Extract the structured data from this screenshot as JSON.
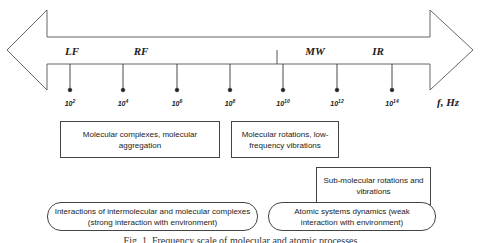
{
  "figure": {
    "axis_unit": "f, Hz",
    "bands": [
      {
        "label": "LF",
        "x": 72
      },
      {
        "label": "RF",
        "x": 141
      },
      {
        "label": "MW",
        "x": 315
      },
      {
        "label": "IR",
        "x": 378
      }
    ],
    "ticks": [
      {
        "base": "10",
        "exp": "2",
        "x": 70
      },
      {
        "base": "10",
        "exp": "4",
        "x": 123
      },
      {
        "base": "10",
        "exp": "6",
        "x": 177
      },
      {
        "base": "10",
        "exp": "8",
        "x": 230
      },
      {
        "base": "10",
        "exp": "10",
        "x": 283
      },
      {
        "base": "10",
        "exp": "12",
        "x": 337
      },
      {
        "base": "10",
        "exp": "14",
        "x": 392
      }
    ],
    "boxes": [
      {
        "text": "Molecular complexes, molecular aggregation"
      },
      {
        "text": "Molecular rotations, low-frequency vibrations"
      },
      {
        "text": "Sub-molecular rotations and vibrations"
      }
    ],
    "regimes": [
      {
        "text": "Interactions of intermolecular and molecular complexes (strong interaction with environment)"
      },
      {
        "text": "Atomic systems dynamics (weak interaction with environment)"
      }
    ],
    "caption": "Fig. 1. Frequency scale of molecular and atomic processes"
  },
  "colors": {
    "stroke": "#444444",
    "text": "#222222",
    "background": "#ffffff"
  }
}
